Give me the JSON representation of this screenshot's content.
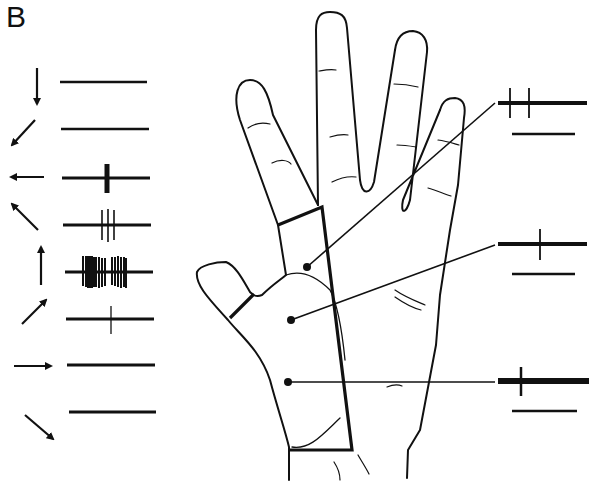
{
  "figure": {
    "panel_label": "B",
    "ink_color": "#111111",
    "background": "#ffffff"
  },
  "direction_tuning": {
    "description": "Spike trains for stimulus motion in 8 directions",
    "rows": [
      {
        "direction": "down",
        "angle_deg": 270,
        "spikes": []
      },
      {
        "direction": "down-left",
        "angle_deg": 225,
        "spikes": []
      },
      {
        "direction": "left",
        "angle_deg": 180,
        "spikes": [
          107,
          108,
          109
        ]
      },
      {
        "direction": "up-left",
        "angle_deg": 135,
        "spikes": [
          102,
          108,
          114
        ]
      },
      {
        "direction": "up",
        "angle_deg": 90,
        "spikes": [
          83,
          85,
          86,
          87,
          88,
          89,
          90,
          91,
          93,
          95,
          97,
          100,
          104,
          112,
          115,
          118,
          120,
          122,
          124,
          126
        ]
      },
      {
        "direction": "up-right",
        "angle_deg": 45,
        "spikes": [
          111
        ]
      },
      {
        "direction": "right",
        "angle_deg": 0,
        "spikes": []
      },
      {
        "direction": "down-right",
        "angle_deg": 315,
        "spikes": []
      }
    ]
  },
  "receptive_field_sites": [
    {
      "site": "proximal-index-finger",
      "traces": [
        {
          "spikes": [
            510,
            521
          ],
          "bold": true
        },
        {
          "spikes": [],
          "bold": false
        }
      ]
    },
    {
      "site": "thenar-eminence",
      "traces": [
        {
          "spikes": [
            540
          ],
          "bold": true
        },
        {
          "spikes": [],
          "bold": false
        }
      ]
    },
    {
      "site": "proximal-palm",
      "traces": [
        {
          "spikes": [
            521
          ],
          "bold": true
        },
        {
          "spikes": [],
          "bold": false
        }
      ]
    }
  ]
}
